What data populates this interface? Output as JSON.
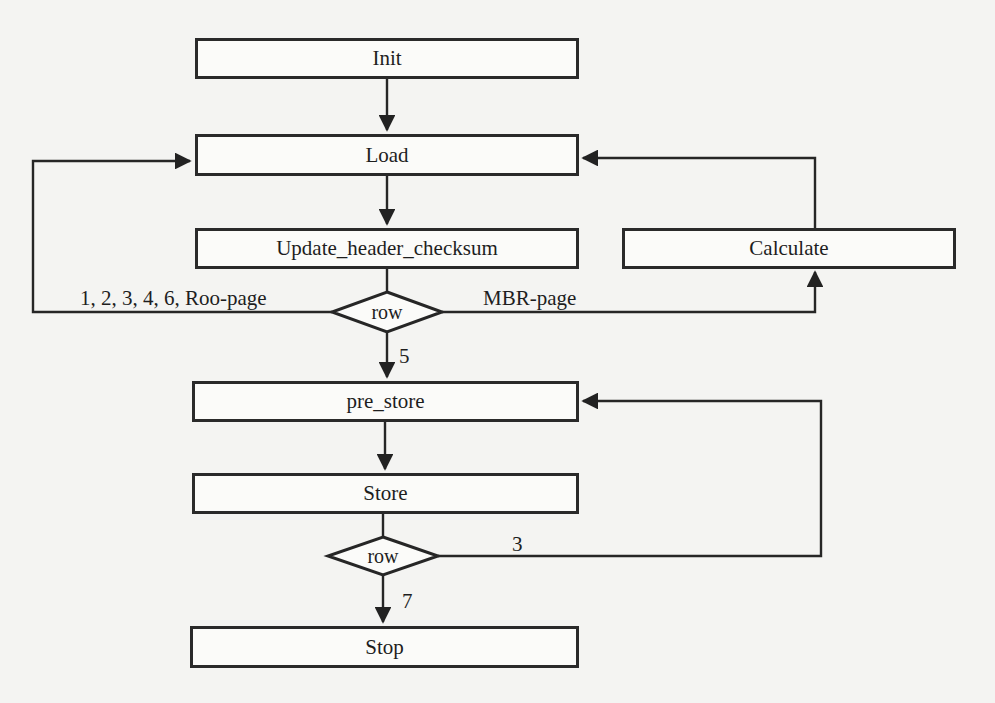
{
  "diagram": {
    "type": "flowchart",
    "nodes": {
      "init": "Init",
      "load": "Load",
      "update": "Update_header_checksum",
      "calculate": "Calculate",
      "decision1": "row",
      "pre_store": "pre_store",
      "store": "Store",
      "decision2": "row",
      "stop": "Stop"
    },
    "edge_labels": {
      "d1_left": "1, 2, 3, 4, 6, Roo-page",
      "d1_right": "MBR-page",
      "d1_down": "5",
      "d2_right": "3",
      "d2_down": "7"
    },
    "edges": [
      {
        "from": "Init",
        "to": "Load"
      },
      {
        "from": "Load",
        "to": "Update_header_checksum"
      },
      {
        "from": "Update_header_checksum",
        "to": "row"
      },
      {
        "from": "row",
        "to": "Load",
        "label": "1, 2, 3, 4, 6, Roo-page"
      },
      {
        "from": "row",
        "to": "Calculate",
        "label": "MBR-page"
      },
      {
        "from": "Calculate",
        "to": "Load"
      },
      {
        "from": "row",
        "to": "pre_store",
        "label": "5"
      },
      {
        "from": "pre_store",
        "to": "Store"
      },
      {
        "from": "Store",
        "to": "row (2)"
      },
      {
        "from": "row (2)",
        "to": "pre_store",
        "label": "3"
      },
      {
        "from": "row (2)",
        "to": "Stop",
        "label": "7"
      }
    ]
  }
}
